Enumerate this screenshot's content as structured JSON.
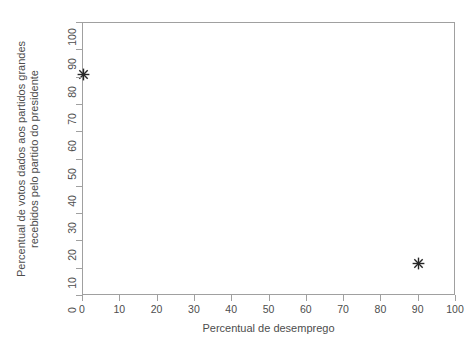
{
  "chart_data": {
    "type": "scatter",
    "title": "",
    "xlabel": "Percentual de desemprego",
    "ylabel_line1": "Percentual de votos dados aos partidos grandes",
    "ylabel_line2": "recebidos pelo partido do presidente",
    "xlim": [
      0,
      100
    ],
    "ylim": [
      0,
      100
    ],
    "xticks": [
      0,
      10,
      20,
      30,
      40,
      50,
      60,
      70,
      80,
      90,
      100
    ],
    "yticks": [
      0,
      10,
      20,
      30,
      40,
      50,
      60,
      70,
      80,
      90,
      100
    ],
    "grid": false,
    "legend": false,
    "marker": "asterisk",
    "marker_color": "#262626",
    "axis_color": "#a0a0a0",
    "text_color": "#4d4d4d",
    "background": "#ffffff",
    "points": [
      {
        "x": 0,
        "y": 81
      },
      {
        "x": 90,
        "y": 12
      }
    ],
    "series": [
      {
        "name": "observacoes",
        "x": [
          0,
          90
        ],
        "y": [
          81,
          12
        ]
      }
    ]
  }
}
